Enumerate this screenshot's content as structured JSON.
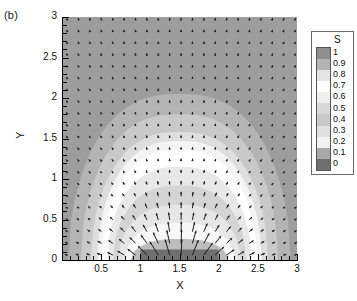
{
  "figure": {
    "panel_label": "(b)",
    "axis_title_x": "X",
    "axis_title_y": "Y"
  },
  "legend": {
    "title": "S",
    "labels": [
      "1",
      "0.9",
      "0.8",
      "0.7",
      "0.6",
      "0.5",
      "0.4",
      "0.3",
      "0.2",
      "0.1",
      "0"
    ],
    "band_colors": [
      "#8f8f8f",
      "#b4b4b4",
      "#e4e4e4",
      "#ffffff",
      "#efefef",
      "#d8d8d8",
      "#c9c9c9",
      "#e0e0e0",
      "#f2f2f2",
      "#a8a8a8",
      "#6f6f6f"
    ]
  },
  "chart_data": {
    "type": "heatmap",
    "title": "",
    "xlabel": "X",
    "ylabel": "Y",
    "xlim": [
      0,
      3
    ],
    "ylim": [
      0,
      3
    ],
    "xticks": [
      0,
      0.5,
      1,
      1.5,
      2,
      2.5,
      3
    ],
    "xticklabels": [
      "",
      "0.5",
      "1",
      "1.5",
      "2",
      "2.5",
      "3"
    ],
    "yticks": [
      0,
      0.5,
      1,
      1.5,
      2,
      2.5,
      3
    ],
    "yticklabels": [
      "0",
      "0.5",
      "1",
      "1.5",
      "2",
      "2.5",
      "3"
    ],
    "minor_tick_step": 0.1,
    "grid": false,
    "legend_position": "right",
    "colorbar_label": "S",
    "colorbar_levels": [
      0,
      0.1,
      0.2,
      0.3,
      0.4,
      0.5,
      0.6,
      0.7,
      0.8,
      0.9,
      1
    ],
    "background_level": 0.1,
    "background_color": "#9d9d9d",
    "source_block": {
      "x0": 1.0,
      "x1": 2.0,
      "y0": 0.0,
      "y1": 0.13,
      "color": "#6f6f6f",
      "description": "dark scalar source strip on the bottom wall"
    },
    "contour_bands": [
      {
        "level": 0.2,
        "color": "#b4b4b4",
        "apex_y": 2.05,
        "half_width": 1.42,
        "y0": 0.0
      },
      {
        "level": 0.3,
        "color": "#c9c9c9",
        "apex_y": 1.8,
        "half_width": 1.26,
        "y0": 0.0
      },
      {
        "level": 0.4,
        "color": "#dedede",
        "apex_y": 1.58,
        "half_width": 1.13,
        "y0": 0.0
      },
      {
        "level": 0.5,
        "color": "#f4f4f4",
        "apex_y": 1.47,
        "half_width": 1.05,
        "y0": 0.0
      },
      {
        "level": 0.6,
        "color": "#ffffff",
        "apex_y": 1.36,
        "half_width": 0.99,
        "y0": 0.0
      },
      {
        "level": 0.7,
        "color": "#e8e8e8",
        "apex_y": 1.15,
        "half_width": 0.92,
        "y0": 0.0
      },
      {
        "level": 0.8,
        "color": "#d4d4d4",
        "apex_y": 0.92,
        "half_width": 0.85,
        "y0": 0.0
      },
      {
        "level": 0.85,
        "color": "#e6e6e6",
        "apex_y": 0.68,
        "half_width": 0.78,
        "y0": 0.0
      },
      {
        "level": 0.9,
        "color": "#f7f7f7",
        "apex_y": 0.46,
        "half_width": 0.7,
        "y0": 0.0
      },
      {
        "level": 0.95,
        "color": "#bdbdbd",
        "apex_y": 0.26,
        "half_width": 0.62,
        "y0": 0.0
      }
    ],
    "vector_field": {
      "description": "velocity vectors radiating upward and outward from the bottom source",
      "grid_spacing_x": 0.145,
      "grid_spacing_y": 0.145,
      "origin": [
        1.5,
        -0.35
      ],
      "max_length": 0.2,
      "color": "#1c1c1c"
    }
  }
}
